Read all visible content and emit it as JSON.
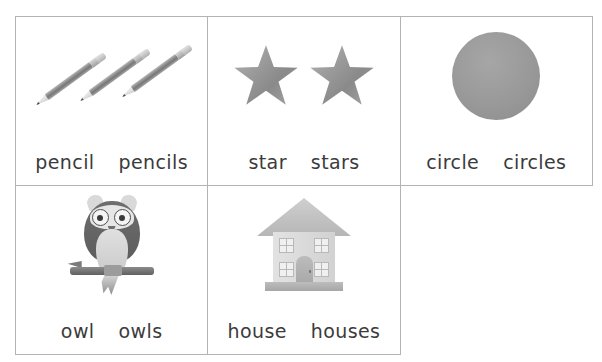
{
  "worksheet": {
    "title": "Singular and plural picture word cards",
    "grid": {
      "columns": 3,
      "rows": 2
    },
    "cells": [
      {
        "id": "pencil",
        "icon": "pencils-icon",
        "icon_count": 3,
        "singular": "pencil",
        "plural": "pencils"
      },
      {
        "id": "star",
        "icon": "stars-icon",
        "icon_count": 2,
        "singular": "star",
        "plural": "stars"
      },
      {
        "id": "circle",
        "icon": "circle-icon",
        "icon_count": 1,
        "singular": "circle",
        "plural": "circles"
      },
      {
        "id": "owl",
        "icon": "owl-icon",
        "icon_count": 1,
        "singular": "owl",
        "plural": "owls"
      },
      {
        "id": "house",
        "icon": "house-icon",
        "icon_count": 1,
        "singular": "house",
        "plural": "houses"
      }
    ]
  },
  "colors": {
    "border": "#b3b3b3",
    "text": "#3b3b3b",
    "background": "#ffffff",
    "artwork_grey": "#9a9a9a",
    "artwork_light_grey": "#d9d9d9",
    "artwork_dark_grey": "#5c5c5c"
  }
}
